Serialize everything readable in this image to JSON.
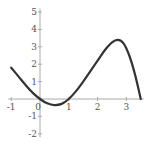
{
  "chart_data": {
    "type": "line",
    "title": "",
    "xlabel": "",
    "ylabel": "",
    "xlim": [
      -1.1,
      3.6
    ],
    "ylim": [
      -2.2,
      5.2
    ],
    "grid": false,
    "x_ticks": [
      -1,
      0,
      1,
      2,
      3
    ],
    "y_ticks": [
      -2,
      -1,
      1,
      2,
      3,
      4,
      5
    ],
    "x_tick_labels": [
      "-1",
      "0",
      "1",
      "2",
      "3"
    ],
    "y_tick_labels": [
      "-2",
      "-1",
      "1",
      "2",
      "3",
      "4",
      "5"
    ],
    "series": [
      {
        "name": "f(x)",
        "x": [
          -1.0,
          -0.75,
          -0.5,
          -0.25,
          0.0,
          0.25,
          0.5,
          0.75,
          1.0,
          1.25,
          1.5,
          1.75,
          2.0,
          2.25,
          2.5,
          2.7,
          2.9,
          3.1,
          3.3,
          3.5
        ],
        "y": [
          1.8,
          1.3,
          0.8,
          0.35,
          0.0,
          -0.25,
          -0.35,
          -0.28,
          0.0,
          0.45,
          1.0,
          1.6,
          2.2,
          2.8,
          3.25,
          3.4,
          3.2,
          2.5,
          1.4,
          0.0
        ]
      }
    ]
  }
}
